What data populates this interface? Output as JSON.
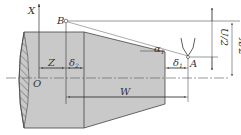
{
  "diagram": {
    "labels": {
      "x_axis": "X",
      "origin": "O",
      "point_b": "B",
      "point_a": "A",
      "z": "Z",
      "delta2": "δ",
      "delta2_sub": "2",
      "delta1": "δ",
      "delta1_sub": "1",
      "alpha1": "α",
      "alpha1_sub": "1",
      "w": "W",
      "u_half": "U/2",
      "x_half": "X/2"
    },
    "colors": {
      "workpiece_fill": "#c9c9c9",
      "line": "#333333"
    }
  }
}
